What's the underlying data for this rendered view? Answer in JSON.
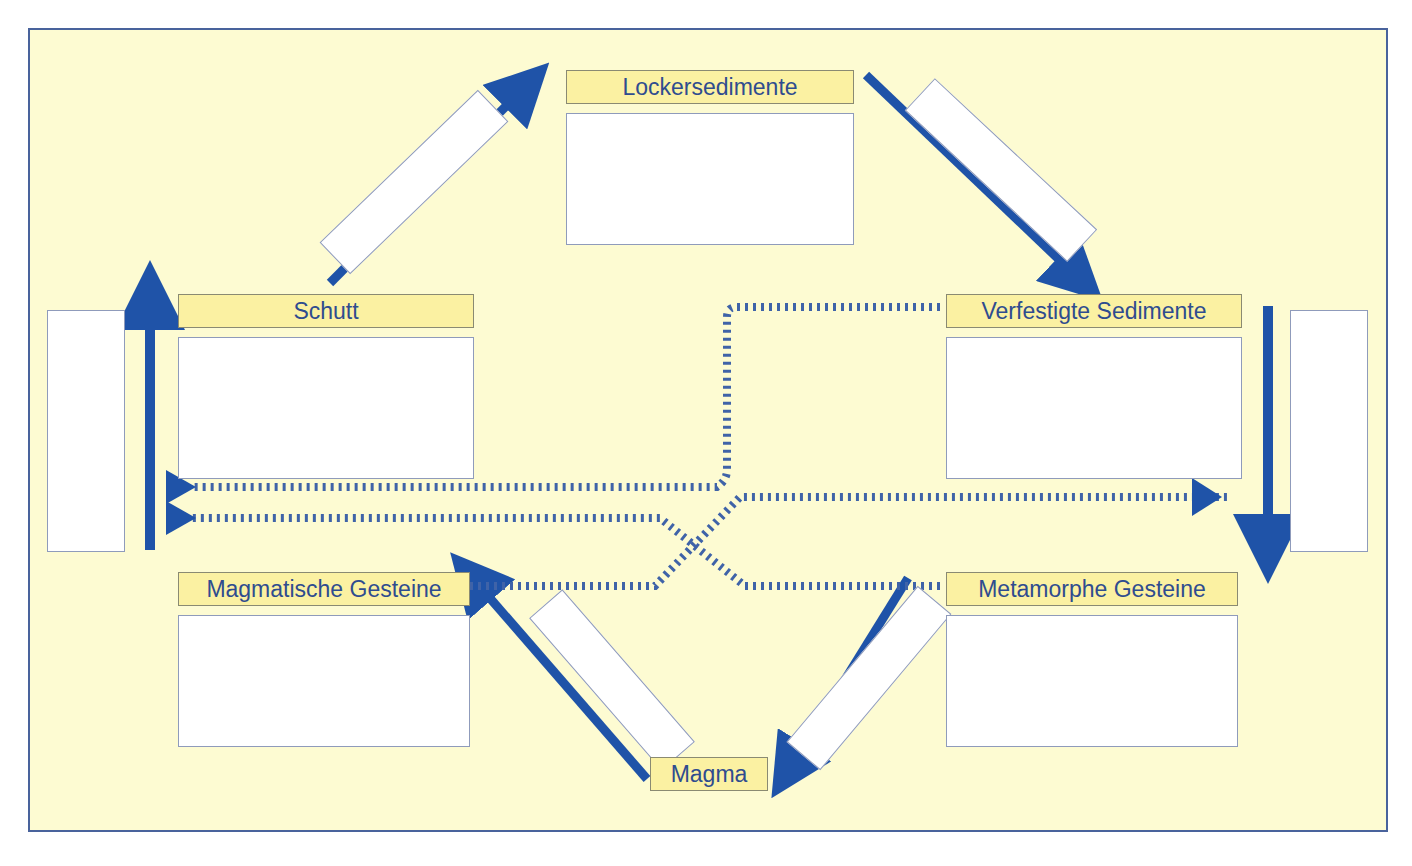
{
  "diagram": {
    "background_color": "#fdfbd2",
    "frame_color": "#49639c",
    "label_fill": "#fbf1a2",
    "label_text_color": "#2f4c8f",
    "arrow_color": "#1f53a8",
    "answer_box_fill": "#ffffff"
  },
  "nodes": [
    {
      "id": "lockersedimente",
      "label": "Lockersedimente",
      "has_answer_box": true
    },
    {
      "id": "schutt",
      "label": "Schutt",
      "has_answer_box": true
    },
    {
      "id": "verfestigte",
      "label": "Verfestigte Sedimente",
      "has_answer_box": true
    },
    {
      "id": "magmatische",
      "label": "Magmatische Gesteine",
      "has_answer_box": true
    },
    {
      "id": "metamorphe",
      "label": "Metamorphe Gesteine",
      "has_answer_box": true
    },
    {
      "id": "magma",
      "label": "Magma",
      "has_answer_box": false
    }
  ],
  "blank_boxes": {
    "left_vertical": "",
    "right_vertical": "",
    "diagonal_top_left": "",
    "diagonal_top_right": "",
    "diagonal_bottom_left": "",
    "diagonal_bottom_right": "",
    "lockersedimente": "",
    "schutt": "",
    "verfestigte": "",
    "magmatische": "",
    "metamorphe": ""
  },
  "arrows": [
    {
      "id": "schutt-to-lockersedimente",
      "style": "solid",
      "from": "schutt",
      "to": "lockersedimente"
    },
    {
      "id": "lockersedimente-to-verfestigte",
      "style": "solid",
      "from": "lockersedimente",
      "to": "verfestigte"
    },
    {
      "id": "verfestigte-down-right",
      "style": "solid",
      "from": "verfestigte",
      "to": "metamorphe"
    },
    {
      "id": "metamorphe-to-magma",
      "style": "solid",
      "from": "metamorphe",
      "to": "magma"
    },
    {
      "id": "magma-to-magmatische",
      "style": "solid",
      "from": "magma",
      "to": "magmatische"
    },
    {
      "id": "magmatische-up-left",
      "style": "solid",
      "from": "magmatische",
      "to": "schutt"
    },
    {
      "id": "verfestigte-to-left",
      "style": "dotted",
      "from": "verfestigte",
      "to": "left-weathering"
    },
    {
      "id": "metamorphe-to-left",
      "style": "dotted",
      "from": "metamorphe",
      "to": "left-weathering"
    },
    {
      "id": "magmatische-to-right",
      "style": "dotted",
      "from": "magmatische",
      "to": "right-metamorphism"
    }
  ]
}
